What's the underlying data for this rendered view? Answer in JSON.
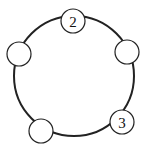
{
  "diagram": {
    "type": "circle-with-nodes",
    "ring": {
      "cx": 74,
      "cy": 76,
      "r": 60
    },
    "nodes": [
      {
        "id": "top",
        "cx": 73,
        "cy": 21,
        "r": 12,
        "label": "2"
      },
      {
        "id": "right",
        "cx": 127,
        "cy": 52,
        "r": 12,
        "label": ""
      },
      {
        "id": "lower-right",
        "cx": 122,
        "cy": 122,
        "r": 12,
        "label": "3"
      },
      {
        "id": "lower-left",
        "cx": 41,
        "cy": 131,
        "r": 12,
        "label": ""
      },
      {
        "id": "left",
        "cx": 19,
        "cy": 54,
        "r": 12,
        "label": ""
      }
    ]
  }
}
